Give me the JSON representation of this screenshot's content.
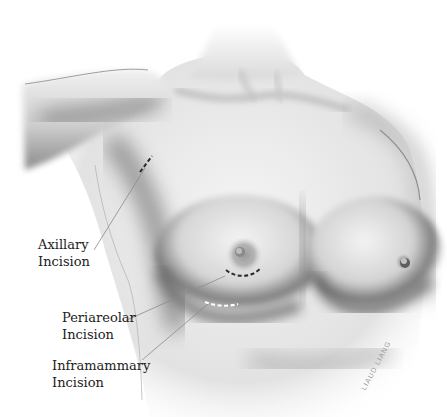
{
  "figure": {
    "palette": {
      "background": "#ffffff",
      "skin_light": "#f2f2f2",
      "skin_mid": "#bdbdbd",
      "skin_dark": "#6e6e6e",
      "leader_line": "#8a8a8a",
      "label_text": "#222222",
      "incision_dark": "#2a2a2a",
      "incision_light": "#ffffff"
    }
  },
  "labels": {
    "axillary": {
      "line1": "Axillary",
      "line2": "Incision"
    },
    "periareolar": {
      "line1": "Periareolar",
      "line2": "Incision"
    },
    "inframammary": {
      "line1": "Inframammary",
      "line2": "Incision"
    }
  },
  "signature": "LIAUD LIANG"
}
